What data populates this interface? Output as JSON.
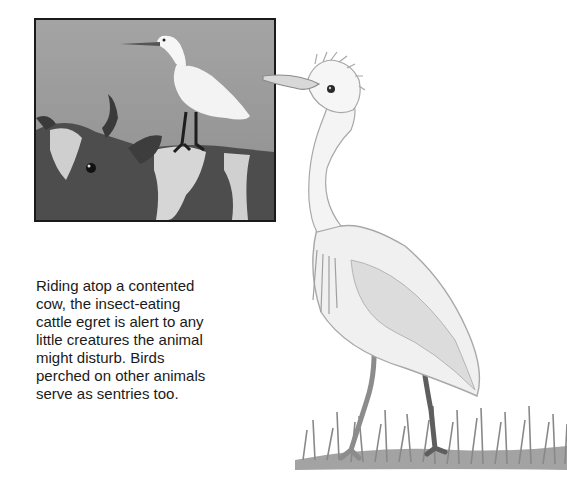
{
  "inset_illustration": {
    "subject": "cattle egret perched on back of a cow",
    "border_color": "#1a1a1a",
    "sky_color": "#9a9a9a",
    "cow_dark": "#4a4a4a",
    "cow_light": "#d8d8d8",
    "egret_color": "#f4f4f4"
  },
  "caption": {
    "lines": [
      "Riding atop a contented",
      "cow, the insect-eating",
      "cattle egret is alert to any",
      "little creatures the animal",
      "might disturb. Birds",
      "perched on other animals",
      "serve as sentries too."
    ]
  },
  "main_illustration": {
    "subject": "standing cattle egret on grass",
    "line_color": "#8a8a8a",
    "grass_color": "#7a7a7a"
  }
}
